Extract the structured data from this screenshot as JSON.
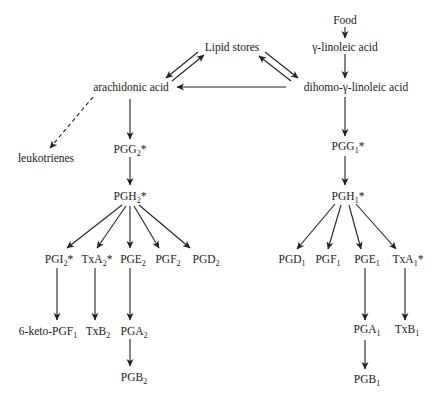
{
  "diagram": {
    "type": "biochemical-pathway",
    "nodes": {
      "food": {
        "label": "Food"
      },
      "gla": {
        "label": "γ-linoleic acid"
      },
      "lipid_stores": {
        "label": "Lipid stores"
      },
      "arachidonic": {
        "label": "arachidonic acid"
      },
      "dgla": {
        "label": "dihomo-γ-linoleic acid"
      },
      "leukotrienes": {
        "label": "leukotrienes"
      },
      "pgg2": {
        "base": "PGG",
        "sub": "2",
        "suffix": "*"
      },
      "pgh2": {
        "base": "PGH",
        "sub": "2",
        "suffix": "*"
      },
      "pgi2": {
        "base": "PGI",
        "sub": "2",
        "suffix": "*"
      },
      "txa2": {
        "base": "TxA",
        "sub": "2",
        "suffix": "*"
      },
      "pge2": {
        "base": "PGE",
        "sub": "2",
        "suffix": ""
      },
      "pgf2": {
        "base": "PGF",
        "sub": "2",
        "suffix": ""
      },
      "pgd2": {
        "base": "PGD",
        "sub": "2",
        "suffix": ""
      },
      "keto_pgf1": {
        "base": "6-keto-PGF",
        "sub": "1",
        "suffix": ""
      },
      "txb2": {
        "base": "TxB",
        "sub": "2",
        "suffix": ""
      },
      "pga2": {
        "base": "PGA",
        "sub": "2",
        "suffix": ""
      },
      "pgb2": {
        "base": "PGB",
        "sub": "2",
        "suffix": ""
      },
      "pgg1": {
        "base": "PGG",
        "sub": "1",
        "suffix": "*"
      },
      "pgh1": {
        "base": "PGH",
        "sub": "1",
        "suffix": "*"
      },
      "pgd1": {
        "base": "PGD",
        "sub": "1",
        "suffix": ""
      },
      "pgf1": {
        "base": "PGF",
        "sub": "1",
        "suffix": ""
      },
      "pge1": {
        "base": "PGE",
        "sub": "1",
        "suffix": ""
      },
      "txa1": {
        "base": "TxA",
        "sub": "1",
        "suffix": "*"
      },
      "pga1": {
        "base": "PGA",
        "sub": "1",
        "suffix": ""
      },
      "txb1": {
        "base": "TxB",
        "sub": "1",
        "suffix": ""
      },
      "pgb1": {
        "base": "PGB",
        "sub": "1",
        "suffix": ""
      }
    },
    "edges": [
      {
        "from": "food",
        "to": "gla",
        "style": "solid"
      },
      {
        "from": "gla",
        "to": "dgla",
        "style": "solid"
      },
      {
        "from": "lipid_stores",
        "to": "arachidonic",
        "style": "solid"
      },
      {
        "from": "arachidonic",
        "to": "lipid_stores",
        "style": "solid"
      },
      {
        "from": "lipid_stores",
        "to": "dgla",
        "style": "solid"
      },
      {
        "from": "dgla",
        "to": "lipid_stores",
        "style": "solid"
      },
      {
        "from": "dgla",
        "to": "arachidonic",
        "style": "solid"
      },
      {
        "from": "arachidonic",
        "to": "leukotrienes",
        "style": "dashed"
      },
      {
        "from": "arachidonic",
        "to": "pgg2",
        "style": "solid"
      },
      {
        "from": "pgg2",
        "to": "pgh2",
        "style": "solid"
      },
      {
        "from": "pgh2",
        "to": "pgi2",
        "style": "solid"
      },
      {
        "from": "pgh2",
        "to": "txa2",
        "style": "solid"
      },
      {
        "from": "pgh2",
        "to": "pge2",
        "style": "solid"
      },
      {
        "from": "pgh2",
        "to": "pgf2",
        "style": "solid"
      },
      {
        "from": "pgh2",
        "to": "pgd2",
        "style": "solid"
      },
      {
        "from": "pgi2",
        "to": "keto_pgf1",
        "style": "solid"
      },
      {
        "from": "txa2",
        "to": "txb2",
        "style": "solid"
      },
      {
        "from": "pge2",
        "to": "pga2",
        "style": "solid"
      },
      {
        "from": "pga2",
        "to": "pgb2",
        "style": "solid"
      },
      {
        "from": "dgla",
        "to": "pgg1",
        "style": "solid"
      },
      {
        "from": "pgg1",
        "to": "pgh1",
        "style": "solid"
      },
      {
        "from": "pgh1",
        "to": "pgd1",
        "style": "solid"
      },
      {
        "from": "pgh1",
        "to": "pgf1",
        "style": "solid"
      },
      {
        "from": "pgh1",
        "to": "pge1",
        "style": "solid"
      },
      {
        "from": "pgh1",
        "to": "txa1",
        "style": "solid"
      },
      {
        "from": "pge1",
        "to": "pga1",
        "style": "solid"
      },
      {
        "from": "txa1",
        "to": "txb1",
        "style": "solid"
      },
      {
        "from": "pga1",
        "to": "pgb1",
        "style": "solid"
      }
    ]
  }
}
